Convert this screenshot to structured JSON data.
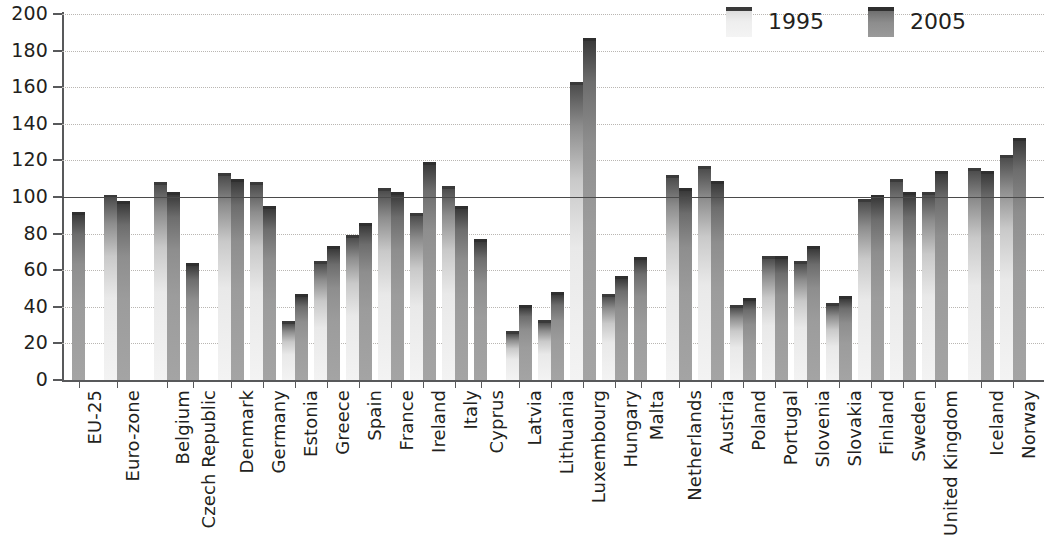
{
  "legend": {
    "position": "top-right",
    "entries": [
      {
        "label": "1995",
        "key": "1995",
        "color": "#eeeeee"
      },
      {
        "label": "2005",
        "key": "2005",
        "color": "#8d8d8d"
      }
    ]
  },
  "axis": {
    "y_ticks": [
      "0",
      "20",
      "40",
      "60",
      "80",
      "100",
      "120",
      "140",
      "160",
      "180",
      "200"
    ],
    "reference_line_value": 100
  },
  "chart_data": {
    "type": "bar",
    "title": "",
    "subtitle": "",
    "xlabel": "",
    "ylabel": "",
    "ylim": [
      0,
      200
    ],
    "ytick_step": 20,
    "grid": true,
    "grid_style": "dotted-horizontal",
    "legend_position": "top-right",
    "reference_line": 100,
    "orientation": "vertical",
    "bar_label_rotation": -90,
    "categories": [
      "EU-25",
      "Euro-zone",
      "Belgium",
      "Czech Republic",
      "Denmark",
      "Germany",
      "Estonia",
      "Greece",
      "Spain",
      "France",
      "Ireland",
      "Italy",
      "Cyprus",
      "Latvia",
      "Lithuania",
      "Luxembourg",
      "Hungary",
      "Malta",
      "Netherlands",
      "Austria",
      "Poland",
      "Portugal",
      "Slovenia",
      "Slovakia",
      "Finland",
      "Sweden",
      "United Kingdom",
      "Iceland",
      "Norway",
      "Japan",
      "United States"
    ],
    "series": [
      {
        "name": "1995",
        "values": [
          null,
          101,
          108,
          null,
          113,
          108,
          null,
          65,
          79,
          105,
          91,
          106,
          null,
          27,
          33,
          163,
          47,
          null,
          112,
          117,
          null,
          68,
          65,
          null,
          99,
          110,
          103,
          116,
          123,
          122,
          149
        ]
      },
      {
        "name": "2005",
        "values": [
          92,
          98,
          103,
          64,
          110,
          95,
          47,
          73,
          86,
          103,
          119,
          95,
          77,
          41,
          48,
          187,
          57,
          67,
          105,
          109,
          45,
          68,
          73,
          46,
          101,
          103,
          114,
          114,
          132,
          104,
          139
        ]
      }
    ],
    "notes": [
      "Estonia 1995 value shown as short bar at 32",
      "Poland 1995 value shown as short bar at 41",
      "Slovakia 1995 value shown as short bar at 42"
    ],
    "series_1995_extra": {
      "Estonia": 32,
      "Poland": 41,
      "Slovakia": 42
    }
  },
  "groups": [
    {
      "label": "EU-25",
      "x": 10,
      "v1995": null,
      "v2005": 92
    },
    {
      "label": "Euro-zone",
      "x": 42,
      "v1995": 101,
      "v2005": 98
    },
    {
      "label": "Belgium",
      "x": 92,
      "v1995": 108,
      "v2005": 103
    },
    {
      "label": "Czech Republic",
      "x": 124,
      "v1995": null,
      "v2005": 64
    },
    {
      "label": "Denmark",
      "x": 156,
      "v1995": 113,
      "v2005": 110
    },
    {
      "label": "Germany",
      "x": 188,
      "v1995": 108,
      "v2005": 95
    },
    {
      "label": "Estonia",
      "x": 220,
      "v1995": 32,
      "v2005": 47
    },
    {
      "label": "Greece",
      "x": 252,
      "v1995": 65,
      "v2005": 73
    },
    {
      "label": "Spain",
      "x": 284,
      "v1995": 79,
      "v2005": 86
    },
    {
      "label": "France",
      "x": 316,
      "v1995": 105,
      "v2005": 103
    },
    {
      "label": "Ireland",
      "x": 348,
      "v1995": 91,
      "v2005": 119
    },
    {
      "label": "Italy",
      "x": 380,
      "v1995": 106,
      "v2005": 95
    },
    {
      "label": "Cyprus",
      "x": 412,
      "v1995": null,
      "v2005": 77
    },
    {
      "label": "Latvia",
      "x": 444,
      "v1995": 27,
      "v2005": 41
    },
    {
      "label": "Lithuania",
      "x": 476,
      "v1995": 33,
      "v2005": 48
    },
    {
      "label": "Luxembourg",
      "x": 508,
      "v1995": 163,
      "v2005": 187
    },
    {
      "label": "Hungary",
      "x": 540,
      "v1995": 47,
      "v2005": 57
    },
    {
      "label": "Malta",
      "x": 572,
      "v1995": null,
      "v2005": 67
    },
    {
      "label": "Netherlands",
      "x": 604,
      "v1995": 112,
      "v2005": 105
    },
    {
      "label": "Austria",
      "x": 636,
      "v1995": 117,
      "v2005": 109
    },
    {
      "label": "Poland",
      "x": 668,
      "v1995": 41,
      "v2005": 45
    },
    {
      "label": "Portugal",
      "x": 700,
      "v1995": 68,
      "v2005": 68
    },
    {
      "label": "Slovenia",
      "x": 732,
      "v1995": 65,
      "v2005": 73
    },
    {
      "label": "Slovakia",
      "x": 764,
      "v1995": 42,
      "v2005": 46
    },
    {
      "label": "Finland",
      "x": 796,
      "v1995": 99,
      "v2005": 101
    },
    {
      "label": "Sweden",
      "x": 828,
      "v1995": 110,
      "v2005": 103
    },
    {
      "label": "United Kingdom",
      "x": 860,
      "v1995": 103,
      "v2005": 114
    },
    {
      "label": "Iceland",
      "x": 906,
      "v1995": 116,
      "v2005": 114
    },
    {
      "label": "Norway",
      "x": 938,
      "v1995": 123,
      "v2005": 132
    },
    {
      "label": "Japan",
      "x": 984,
      "v1995": 122,
      "v2005": 104
    },
    {
      "label": "United States",
      "x": 1014,
      "v1995": 149,
      "v2005": 139
    }
  ]
}
